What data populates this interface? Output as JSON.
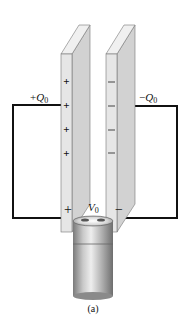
{
  "figure": {
    "caption": "(a)",
    "left_plate": {
      "charge_label_sign": "+",
      "charge_label_symbol": "Q",
      "charge_label_sub": "0",
      "charge_marks": [
        "+",
        "+",
        "+",
        "+"
      ]
    },
    "right_plate": {
      "charge_label_sign": "−",
      "charge_label_symbol": "Q",
      "charge_label_sub": "0",
      "charge_marks": [
        "−",
        "−",
        "−",
        "−"
      ]
    },
    "battery": {
      "voltage_symbol": "V",
      "voltage_sub": "0",
      "positive_terminal": "+",
      "negative_terminal": "−"
    },
    "colors": {
      "wire": "#111111",
      "plate_front": "#e4e4e4",
      "plate_side": "#cfcfcf",
      "plate_top": "#f2f2f2",
      "plate_edge": "#6a6a6a"
    }
  }
}
